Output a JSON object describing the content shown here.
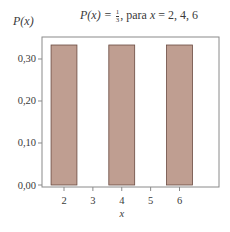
{
  "chart_data": {
    "type": "bar",
    "title_parts": {
      "lhs": "P(x) = ",
      "num": "1",
      "den": "3",
      "rest": ",  para ",
      "var": "x",
      "vals": " = 2, 4, 6"
    },
    "xlabel": "x",
    "ylabel": "P(x)",
    "categories": [
      2,
      4,
      6
    ],
    "values": [
      0.3333,
      0.3333,
      0.3333
    ],
    "x_ticks": [
      "2",
      "3",
      "4",
      "5",
      "6"
    ],
    "y_ticks": [
      "0,00",
      "0,10",
      "0,20",
      "0,30"
    ],
    "ylim": [
      0,
      0.35
    ],
    "xlim": [
      1.4,
      6.6
    ],
    "bar_width": 1.0,
    "grid": false,
    "legend": null,
    "colors": {
      "bar_fill": "#bf9e91",
      "bar_edge": "#6a4a40",
      "frame": "#8a8a8a",
      "text": "#3a3a3a"
    }
  }
}
